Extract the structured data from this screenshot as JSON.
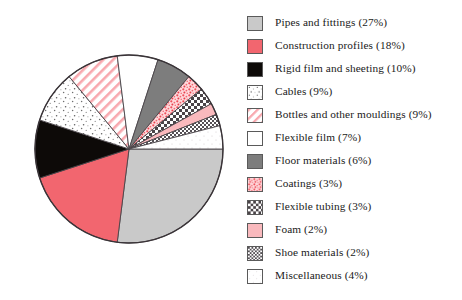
{
  "chart_data": {
    "type": "pie",
    "title": "",
    "subtitle": "",
    "xlabel": "",
    "ylabel": "",
    "legend_position": "right",
    "grid": false,
    "start_angle_deg": 0,
    "direction": "clockwise",
    "categories": [
      "Pipes and fittings",
      "Construction profiles",
      "Rigid film and sheeting",
      "Cables",
      "Bottles and other mouldings",
      "Flexible film",
      "Floor materials",
      "Coatings",
      "Flexible tubing",
      "Foam",
      "Shoe materials",
      "Miscellaneous"
    ],
    "values": [
      27,
      18,
      10,
      9,
      9,
      7,
      6,
      3,
      3,
      2,
      2,
      4
    ],
    "unit": "%",
    "slices": [
      {
        "label": "Pipes and fittings",
        "value": 27,
        "value_text": "27%",
        "fill": "#c9c9c9",
        "pattern": "solid"
      },
      {
        "label": "Construction profiles",
        "value": 18,
        "value_text": "18%",
        "fill": "#f2666f",
        "pattern": "solid"
      },
      {
        "label": "Rigid film and sheeting",
        "value": 10,
        "value_text": "10%",
        "fill": "#0d0a08",
        "pattern": "solid"
      },
      {
        "label": "Cables",
        "value": 9,
        "value_text": "9%",
        "fill": "#ffffff",
        "pattern": "speckle-gray"
      },
      {
        "label": "Bottles and other mouldings",
        "value": 9,
        "value_text": "9%",
        "fill": "#ffffff",
        "pattern": "diagonal-red"
      },
      {
        "label": "Flexible film",
        "value": 7,
        "value_text": "7%",
        "fill": "#ffffff",
        "pattern": "solid"
      },
      {
        "label": "Floor materials",
        "value": 6,
        "value_text": "6%",
        "fill": "#7d7d7d",
        "pattern": "solid"
      },
      {
        "label": "Coatings",
        "value": 3,
        "value_text": "3%",
        "fill": "#ffffff",
        "pattern": "mottle-red"
      },
      {
        "label": "Flexible tubing",
        "value": 3,
        "value_text": "3%",
        "fill": "#ffffff",
        "pattern": "checker"
      },
      {
        "label": "Foam",
        "value": 2,
        "value_text": "2%",
        "fill": "#f9b9bd",
        "pattern": "solid"
      },
      {
        "label": "Shoe materials",
        "value": 2,
        "value_text": "2%",
        "fill": "#ffffff",
        "pattern": "fine-checker"
      },
      {
        "label": "Miscellaneous",
        "value": 4,
        "value_text": "4%",
        "fill": "#ffffff",
        "pattern": "dots-faint"
      }
    ]
  },
  "legend": {
    "items": [
      {
        "text": "Pipes and fittings (27%)"
      },
      {
        "text": "Construction profiles (18%)"
      },
      {
        "text": "Rigid film and sheeting (10%)"
      },
      {
        "text": "Cables (9%)"
      },
      {
        "text": "Bottles and other mouldings (9%)"
      },
      {
        "text": "Flexible film (7%)"
      },
      {
        "text": "Floor materials (6%)"
      },
      {
        "text": "Coatings (3%)"
      },
      {
        "text": "Flexible tubing (3%)"
      },
      {
        "text": "Foam (2%)"
      },
      {
        "text": "Shoe materials (2%)"
      },
      {
        "text": "Miscellaneous (4%)"
      }
    ]
  },
  "colors": {
    "pie_outline": "#3a3438",
    "slice_edge": "#4a4448",
    "accent_red": "#f2666f",
    "light_gray": "#c9c9c9",
    "dark_gray": "#7d7d7d",
    "black": "#0d0a08",
    "pink": "#f9b9bd",
    "background": "#ffffff",
    "text": "#1a1a1a"
  }
}
